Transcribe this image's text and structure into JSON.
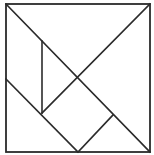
{
  "diagram": {
    "type": "tangram",
    "title": "",
    "stroke_color": "#2b2b2b",
    "background": "#ffffff",
    "outer_square": {
      "x1": 6,
      "y1": 4,
      "x2": 150,
      "y2": 152
    },
    "lines": [
      {
        "id": "diagonal-main",
        "x1": 6,
        "y1": 4,
        "x2": 150,
        "y2": 152
      },
      {
        "id": "diagonal-partial",
        "x1": 150,
        "y1": 4,
        "x2": 42,
        "y2": 113
      },
      {
        "id": "vertical-inner",
        "x1": 42,
        "y1": 41,
        "x2": 42,
        "y2": 113
      },
      {
        "id": "left-diagonal",
        "x1": 6,
        "y1": 79,
        "x2": 78,
        "y2": 152
      },
      {
        "id": "bottom-short",
        "x1": 78,
        "y1": 152,
        "x2": 113,
        "y2": 115
      }
    ],
    "pieces": [
      "large-triangle-top",
      "large-triangle-right",
      "medium-triangle-bottom-left",
      "small-triangle-center",
      "small-triangle-bottom-right",
      "square",
      "parallelogram"
    ]
  }
}
